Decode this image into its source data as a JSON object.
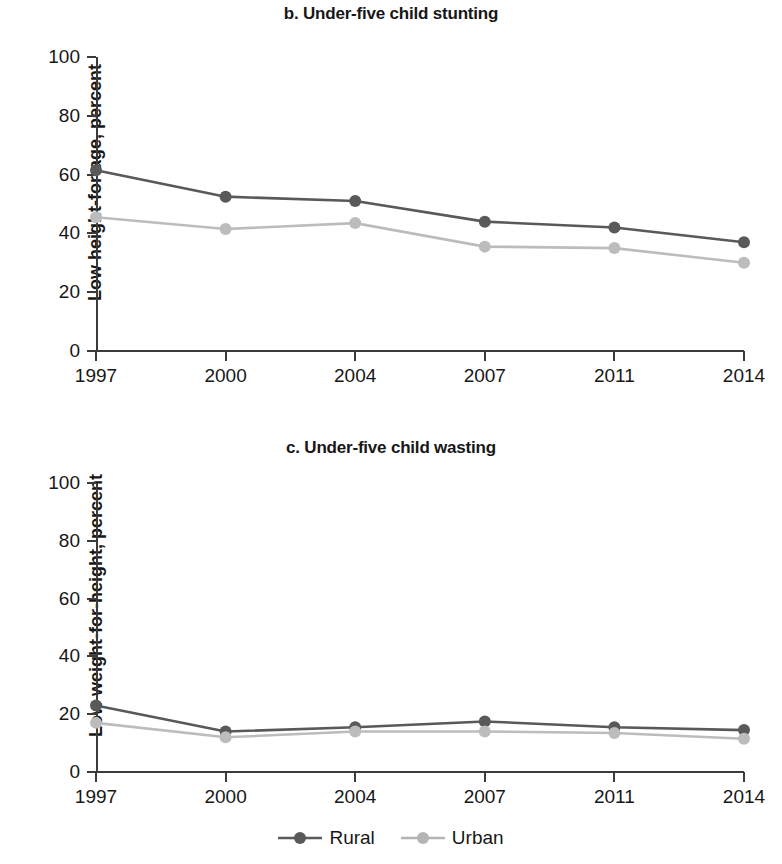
{
  "figure": {
    "legend": {
      "entries": [
        {
          "name": "Rural",
          "color": "#595959"
        },
        {
          "name": "Urban",
          "color": "#b4b4b4"
        }
      ]
    }
  },
  "chart_data": [
    {
      "type": "line",
      "title": "b. Under-five child stunting",
      "xlabel": "",
      "ylabel": "Low height-for-age, percent",
      "x": [
        "1997",
        "2000",
        "2004",
        "2007",
        "2011",
        "2014"
      ],
      "categories": [
        "1997",
        "2000",
        "2004",
        "2007",
        "2011",
        "2014"
      ],
      "yticks": [
        0,
        20,
        40,
        60,
        80,
        100
      ],
      "ylim": [
        0,
        100
      ],
      "grid": false,
      "legend_position": "bottom-center",
      "series": [
        {
          "name": "Rural",
          "color": "#595959",
          "values": [
            61.5,
            52.5,
            51,
            44,
            42,
            37
          ]
        },
        {
          "name": "Urban",
          "color": "#bcbcbc",
          "values": [
            45.5,
            41.5,
            43.5,
            35.5,
            35,
            30
          ]
        }
      ]
    },
    {
      "type": "line",
      "title": "c. Under-five child wasting",
      "xlabel": "",
      "ylabel": "Low weight-for-height, percent",
      "x": [
        "1997",
        "2000",
        "2004",
        "2007",
        "2011",
        "2014"
      ],
      "categories": [
        "1997",
        "2000",
        "2004",
        "2007",
        "2011",
        "2014"
      ],
      "yticks": [
        0,
        20,
        40,
        60,
        80,
        100
      ],
      "ylim": [
        0,
        100
      ],
      "grid": false,
      "legend_position": "bottom-center",
      "series": [
        {
          "name": "Rural",
          "color": "#595959",
          "values": [
            23,
            14,
            15.5,
            17.5,
            15.5,
            14.5
          ]
        },
        {
          "name": "Urban",
          "color": "#bcbcbc",
          "values": [
            17,
            12,
            14,
            14,
            13.5,
            11.5
          ]
        }
      ]
    }
  ]
}
